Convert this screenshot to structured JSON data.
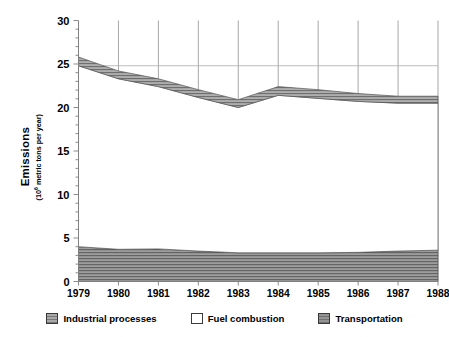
{
  "chart_data": {
    "type": "area",
    "title": "",
    "subtitle": "",
    "xlabel": "",
    "ylabel": "Emissions",
    "ylabel_sub": "(10⁶ metric tons per year)",
    "ylabel_sub_base": "(10",
    "ylabel_sub_exp": "6",
    "ylabel_sub_tail": " metric tons per year)",
    "stacked": true,
    "grid": "vertical gridlines at each year plus one horizontal reference line near 25",
    "legend_position": "bottom-center",
    "xlim": [
      1979,
      1988
    ],
    "ylim": [
      0,
      30
    ],
    "yticks": [
      0,
      5,
      10,
      15,
      20,
      25,
      30
    ],
    "ytick_labels": [
      "0",
      "5",
      "10",
      "15",
      "20",
      "25",
      "30"
    ],
    "y_minor_tick_step": 1,
    "categories": [
      1979,
      1980,
      1981,
      1982,
      1983,
      1984,
      1985,
      1986,
      1987,
      1988
    ],
    "xtick_labels": [
      "1979",
      "1980",
      "1981",
      "1982",
      "1983",
      "1984",
      "1985",
      "1986",
      "1987",
      "1988"
    ],
    "series": [
      {
        "name": "Transportation",
        "stack_order": 1,
        "color": "#949494",
        "pattern": "horizontal-hatch",
        "values": [
          4.0,
          3.7,
          3.75,
          3.5,
          3.3,
          3.3,
          3.3,
          3.35,
          3.5,
          3.6
        ]
      },
      {
        "name": "Fuel combustion",
        "stack_order": 2,
        "color": "#ffffff",
        "pattern": "none",
        "values": [
          20.8,
          19.6,
          18.65,
          17.65,
          16.7,
          18.1,
          17.75,
          17.35,
          17.0,
          16.9
        ]
      },
      {
        "name": "Industrial processes",
        "stack_order": 3,
        "color": "#a9a9a9",
        "pattern": "horizontal-hatch",
        "values": [
          1.0,
          0.9,
          0.9,
          0.9,
          0.9,
          1.0,
          1.0,
          0.9,
          0.8,
          0.8
        ]
      }
    ],
    "cumulative_tops": {
      "transportation": [
        4.0,
        3.7,
        3.75,
        3.5,
        3.3,
        3.3,
        3.3,
        3.35,
        3.5,
        3.6
      ],
      "fuel_combustion": [
        24.8,
        23.3,
        22.4,
        21.15,
        20.0,
        21.4,
        21.05,
        20.7,
        20.5,
        20.5
      ],
      "total": [
        25.8,
        24.2,
        23.3,
        22.05,
        20.9,
        22.4,
        22.05,
        21.6,
        21.3,
        21.3
      ]
    },
    "reference_line": {
      "y": 24.8,
      "style": "thin solid grey",
      "extends_to": "right edge of plot"
    }
  },
  "legend": {
    "items": [
      {
        "label": "Industrial processes",
        "swatch": "hatched-grey-swatch"
      },
      {
        "label": "Fuel combustion",
        "swatch": "white-swatch"
      },
      {
        "label": "Transportation",
        "swatch": "solid-grey-swatch"
      }
    ]
  },
  "colors": {
    "axis": "#808080",
    "gridline": "#909090",
    "text": "#000000",
    "band_top": "#a9a9a9",
    "band_bottom": "#949494",
    "band_middle": "#ffffff"
  }
}
